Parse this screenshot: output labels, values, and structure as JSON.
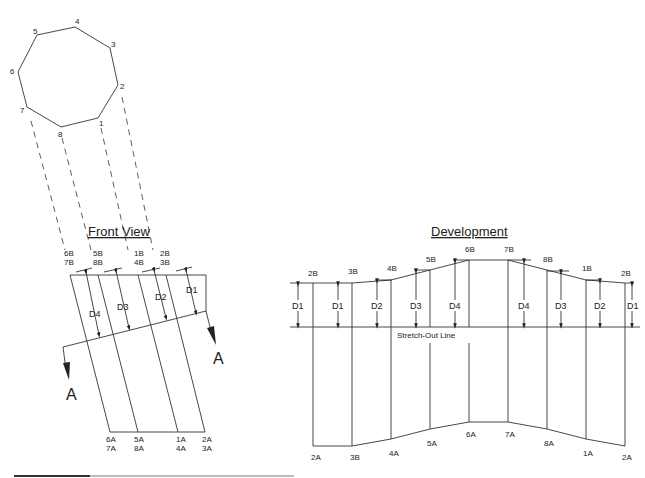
{
  "octagon": {
    "vertex_labels": [
      "1",
      "2",
      "3",
      "4",
      "5",
      "6",
      "7",
      "8"
    ]
  },
  "front_view": {
    "title": "Front View",
    "top_labels": [
      [
        "6B",
        "7B"
      ],
      [
        "5B",
        "8B"
      ],
      [
        "1B",
        "4B"
      ],
      [
        "2B",
        "3B"
      ]
    ],
    "bottom_labels": [
      [
        "6A",
        "7A"
      ],
      [
        "5A",
        "8A"
      ],
      [
        "1A",
        "4A"
      ],
      [
        "2A",
        "3A"
      ]
    ],
    "dims": [
      "D4",
      "D3",
      "D2",
      "D1"
    ],
    "section_label": "A"
  },
  "development": {
    "title": "Development",
    "top_labels": [
      "2B",
      "3B",
      "4B",
      "5B",
      "6B",
      "7B",
      "8B",
      "1B",
      "2B"
    ],
    "bottom_labels": [
      "2A",
      "3B",
      "4A",
      "5A",
      "6A",
      "7A",
      "8A",
      "1A",
      "2A"
    ],
    "dims": [
      "D1",
      "D1",
      "D2",
      "D3",
      "D4",
      "D4",
      "D3",
      "D2",
      "D1"
    ],
    "stretch_out_label": "Stretch-Out Line"
  },
  "colors": {
    "line": "#333333",
    "text": "#222222",
    "background": "#ffffff"
  }
}
